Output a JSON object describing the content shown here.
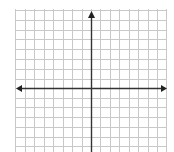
{
  "diagram": {
    "type": "coordinate-plane",
    "grid": {
      "x_lines": [
        15,
        25,
        34,
        44,
        53,
        63,
        72,
        82,
        91,
        100,
        110,
        119,
        129,
        138,
        148,
        157,
        166
      ],
      "y_lines": [
        10,
        20,
        30,
        39,
        49,
        59,
        69,
        79,
        88,
        98,
        107,
        117,
        127,
        137,
        146
      ],
      "left": 15,
      "right": 166,
      "top": 9,
      "bottom": 152,
      "line_color": "#c8c8c8"
    },
    "x_axis": {
      "y": 88,
      "x1": 16,
      "x2": 167,
      "arrows": [
        "left",
        "right"
      ],
      "color": "#333333"
    },
    "y_axis": {
      "x": 91,
      "y1": 11,
      "y2": 152,
      "arrows": [
        "up"
      ],
      "color": "#333333"
    },
    "labels": []
  }
}
